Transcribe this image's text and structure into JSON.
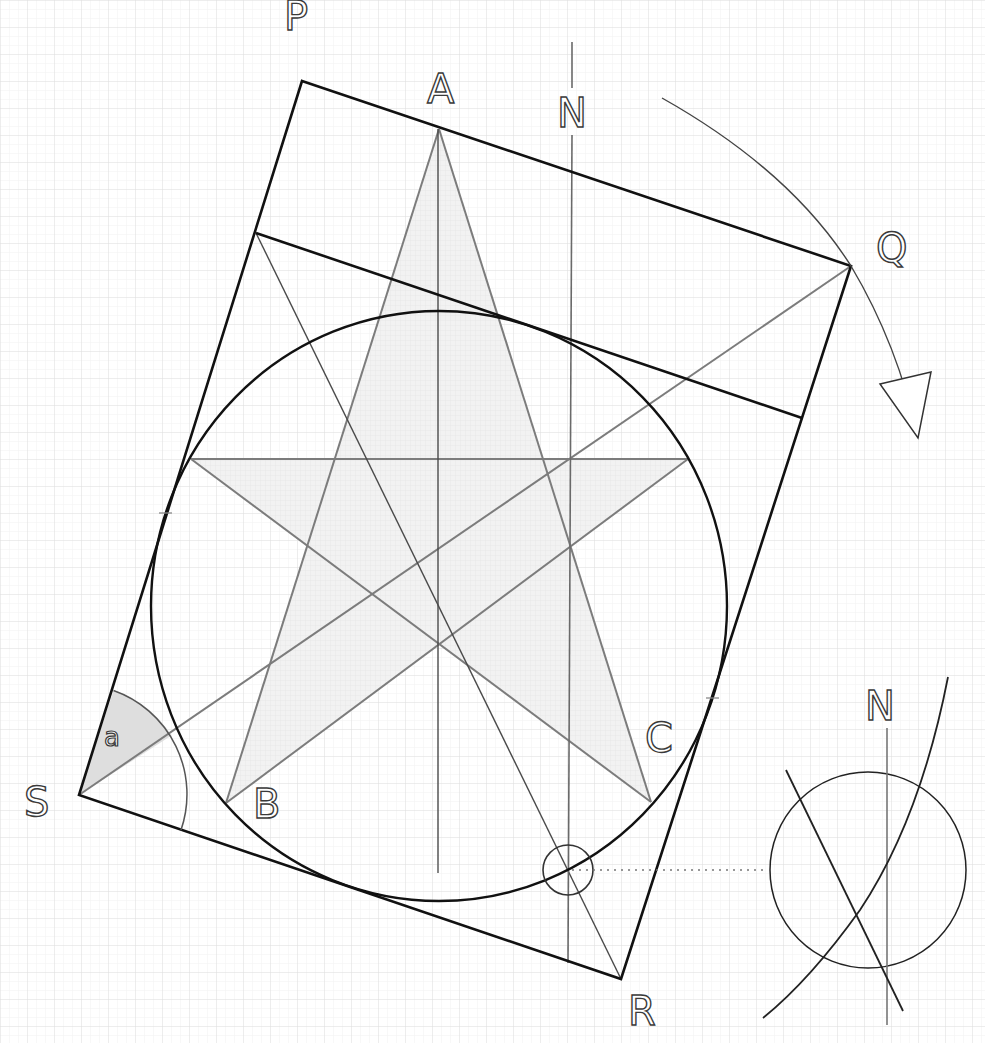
{
  "diagram": {
    "title": "",
    "colors": {
      "background": "#ffffff",
      "grid_major": "#e2e2e2",
      "grid_minor": "#f0f0f0",
      "thick_line": "#111111",
      "thin_line": "#555555",
      "star_line": "#7a7a7a",
      "star_fill": "#eeeeee",
      "angle_fill": "#dcdcdc"
    },
    "labels": {
      "P": "P",
      "Q": "Q",
      "R": "R",
      "S": "S",
      "A": "A",
      "B": "B",
      "C": "C",
      "N_main": "N",
      "N_detail": "N",
      "angle": "a"
    },
    "points": {
      "P": [
        302,
        81
      ],
      "Q": [
        851,
        266
      ],
      "R": [
        621,
        979
      ],
      "S": [
        79,
        795
      ],
      "A": [
        439,
        129
      ],
      "B": [
        226,
        803
      ],
      "C": [
        651,
        802
      ],
      "star_left": [
        191,
        459
      ],
      "star_right": [
        688,
        459
      ],
      "inner_top_left": [
        256,
        233
      ],
      "inner_top_right": [
        802,
        418
      ]
    },
    "circle": {
      "cx": 439,
      "cy": 606,
      "rx": 288,
      "ry": 295
    },
    "north_line": {
      "x": 572,
      "y_top": 42,
      "y_gap_start": 88,
      "y_gap_end": 135,
      "y_bottom": 963
    },
    "marker_circle": {
      "cx": 568,
      "cy": 870,
      "r": 25
    },
    "detail_inset": {
      "circle": {
        "cx": 868,
        "cy": 870,
        "r": 98
      },
      "north_x": 887,
      "north_y_top": 728,
      "north_y_bottom": 1025
    },
    "rotation_arrow": {
      "direction": "clockwise"
    }
  }
}
